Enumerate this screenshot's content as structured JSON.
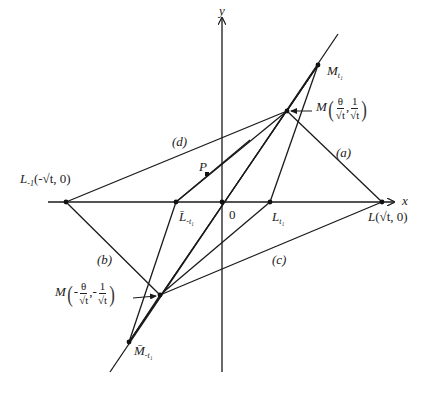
{
  "figure": {
    "axes": {
      "x_label": "x",
      "y_label": "y",
      "origin_label": "0"
    },
    "points": {
      "L_neg1": {
        "name": "L",
        "sub": "-1",
        "coord_text": "(-√t, 0)",
        "x": -1,
        "y": 0
      },
      "L": {
        "name": "L",
        "coord_text": "(√t, 0)",
        "x": 1,
        "y": 0
      },
      "L_t1": {
        "name": "L",
        "sub": "t₁"
      },
      "Lbar_neg_t1": {
        "name": "L̄",
        "sub": "-t₁"
      },
      "M_t1": {
        "name": "M",
        "sub": "t₁"
      },
      "M_pos": {
        "name": "M",
        "num1": "θ",
        "den1": "√t",
        "num2": "1",
        "den2": "√t",
        "sign": ""
      },
      "M_neg": {
        "name": "M",
        "num1": "θ",
        "den1": "√t",
        "num2": "1",
        "den2": "√t",
        "sign": "-"
      },
      "Mbar_neg_t1": {
        "name": "M̄",
        "sub": "-t₁"
      },
      "P": {
        "name": "P"
      }
    },
    "line_labels": {
      "a": "(a)",
      "b": "(b)",
      "c": "(c)",
      "d": "(d)"
    },
    "colors": {
      "stroke": "#1a1a1a",
      "background": "#ffffff"
    }
  }
}
